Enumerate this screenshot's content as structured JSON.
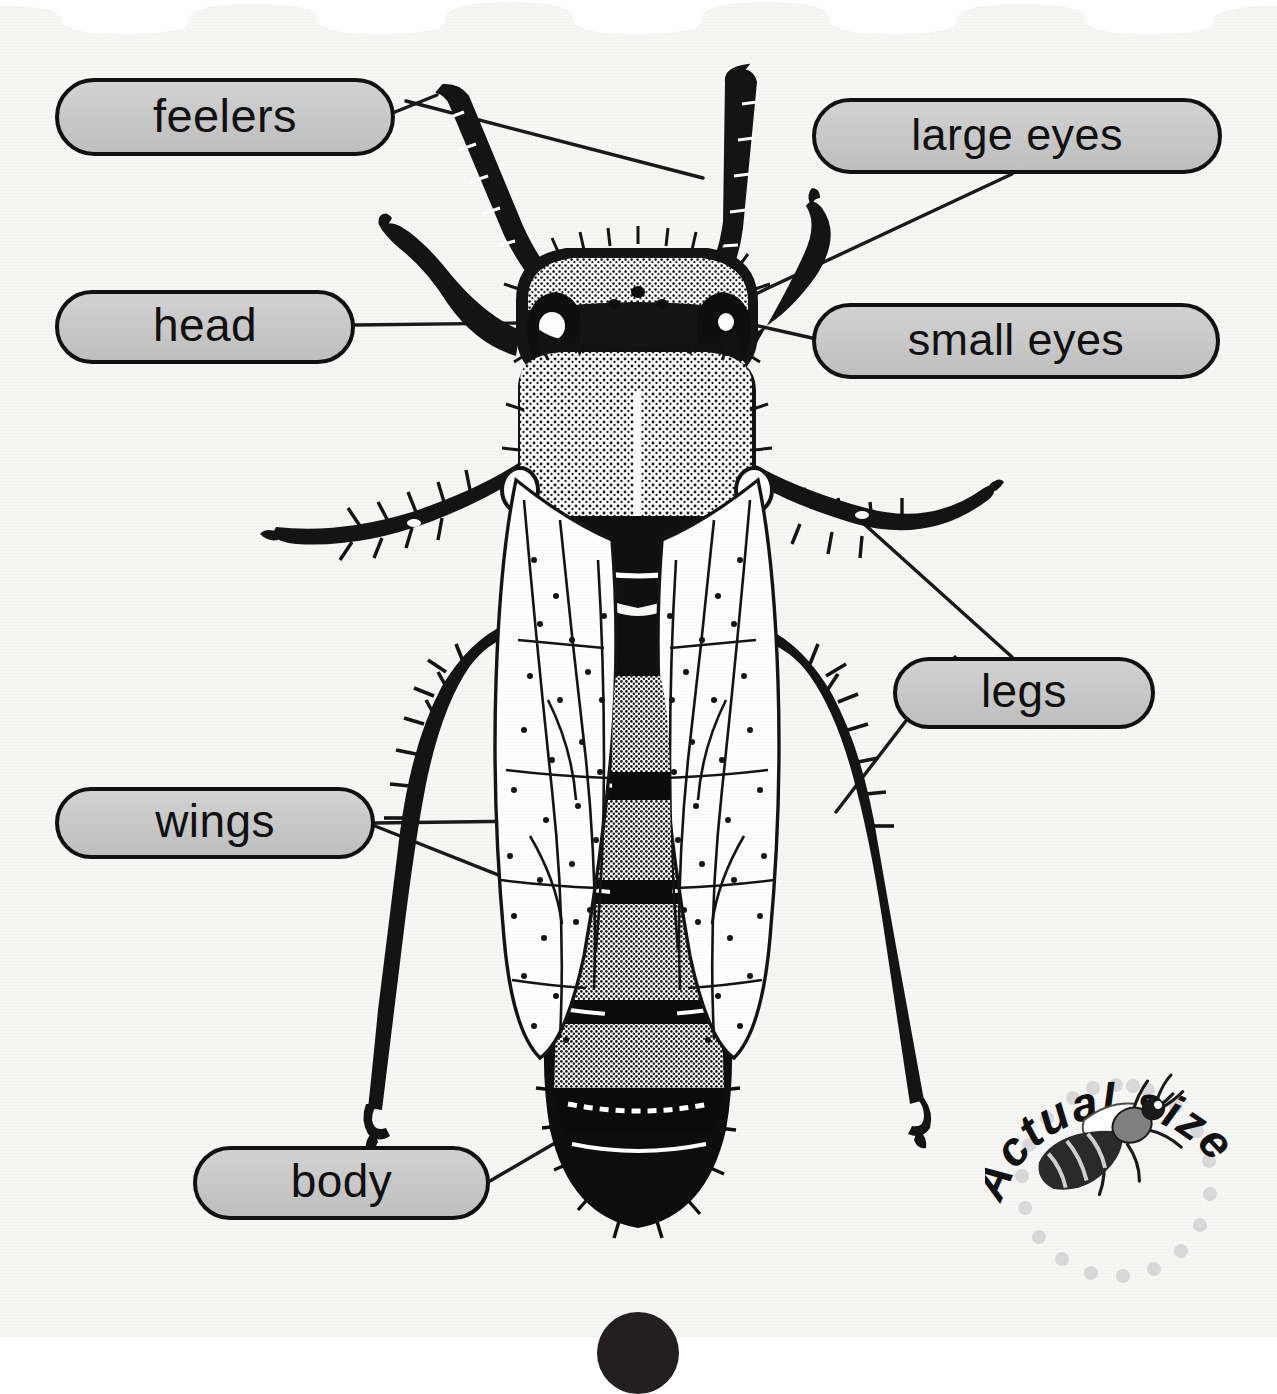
{
  "page": {
    "background_color": "#f7f7f5",
    "pill_fill_color": "#c8c8c8",
    "pill_border_color": "#111111",
    "ink_color": "#1a1a1a"
  },
  "diagram": {
    "labels": [
      {
        "id": "feelers",
        "text": "feelers",
        "side": "left"
      },
      {
        "id": "large-eyes",
        "text": "large eyes",
        "side": "right"
      },
      {
        "id": "head",
        "text": "head",
        "side": "left"
      },
      {
        "id": "small-eyes",
        "text": "small eyes",
        "side": "right"
      },
      {
        "id": "legs",
        "text": "legs",
        "side": "right"
      },
      {
        "id": "wings",
        "text": "wings",
        "side": "left"
      },
      {
        "id": "body",
        "text": "body",
        "side": "left"
      }
    ]
  },
  "badge": {
    "text": "Actual size",
    "letters": [
      "A",
      "c",
      "t",
      "u",
      "a",
      "l",
      " ",
      "s",
      "i",
      "z",
      "e"
    ],
    "dot_color": "#d8d8d8",
    "illustration": "small-bee-icon"
  }
}
